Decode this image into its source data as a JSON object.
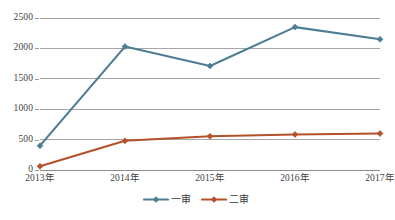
{
  "chart_data": {
    "type": "line",
    "title": "",
    "xlabel": "",
    "ylabel": "",
    "categories": [
      "2013年",
      "2014年",
      "2015年",
      "2016年",
      "2017年"
    ],
    "series": [
      {
        "name": "一审",
        "color": "#4E7C93",
        "marker": "diamond",
        "values": [
          400,
          2030,
          1710,
          2350,
          2150
        ]
      },
      {
        "name": "二审",
        "color": "#B4512B",
        "marker": "diamond",
        "values": [
          60,
          480,
          555,
          585,
          600
        ]
      }
    ],
    "ylim": [
      0,
      2500
    ],
    "ytick_labels": [
      "0",
      "500",
      "1000",
      "1500",
      "2000",
      "2500"
    ],
    "ytick_values": [
      0,
      500,
      1000,
      1500,
      2000,
      2500
    ],
    "grid": true,
    "grid_axis": "y",
    "grid_color": "#808080",
    "legend_position": "bottom-center",
    "legend_entries": [
      "一审",
      "二审"
    ]
  }
}
